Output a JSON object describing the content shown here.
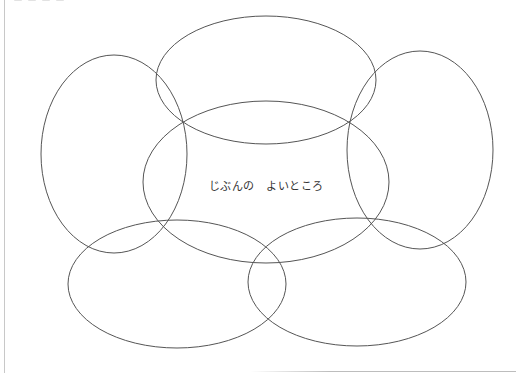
{
  "worksheet": {
    "center_label": "じぶんの　よいところ",
    "stroke_color": "#555555",
    "background_color": "#ffffff"
  },
  "diagram": {
    "type": "flower-ellipse-map",
    "petals": [
      {
        "id": "top",
        "cx": 266,
        "cy": 80,
        "rx": 110,
        "ry": 64,
        "text": ""
      },
      {
        "id": "left",
        "cx": 114,
        "cy": 154,
        "rx": 73,
        "ry": 99,
        "text": ""
      },
      {
        "id": "right",
        "cx": 420,
        "cy": 150,
        "rx": 73,
        "ry": 99,
        "text": ""
      },
      {
        "id": "bottom-left",
        "cx": 177,
        "cy": 284,
        "rx": 109,
        "ry": 64,
        "text": ""
      },
      {
        "id": "bottom-right",
        "cx": 357,
        "cy": 282,
        "rx": 109,
        "ry": 64,
        "text": ""
      }
    ],
    "center": {
      "id": "center",
      "cx": 266,
      "cy": 182,
      "rx": 123,
      "ry": 81,
      "text": "じぶんの　よいところ"
    }
  }
}
